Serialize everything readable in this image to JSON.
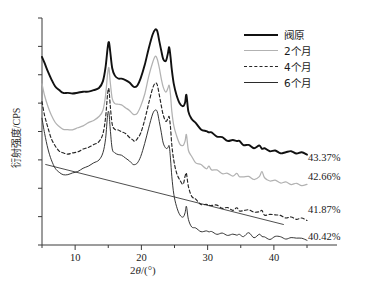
{
  "figure": {
    "ylabel": "衍射强度/CPS",
    "xlabel_prefix": "2",
    "xlabel_theta": "θ",
    "xlabel_suffix": "/(°)"
  },
  "legend": {
    "items": [
      {
        "label": "阀原",
        "style": "solid-thick",
        "color": "#111111"
      },
      {
        "label": "2个月",
        "style": "solid-gray",
        "color": "#b2b2b2"
      },
      {
        "label": "4个月",
        "style": "dashed",
        "color": "#262626"
      },
      {
        "label": "6个月",
        "style": "solid-thin",
        "color": "#2b2b2b"
      }
    ]
  },
  "annotations": [
    {
      "text": "43.37%",
      "series": "阀原"
    },
    {
      "text": "42.66%",
      "series": "2个月"
    },
    {
      "text": "41.87%",
      "series": "4个月"
    },
    {
      "text": "40.42%",
      "series": "6个月"
    }
  ],
  "xticks": [
    {
      "label": "10",
      "value": 10
    },
    {
      "label": "20",
      "value": 20
    },
    {
      "label": "30",
      "value": 30
    },
    {
      "label": "40",
      "value": 40
    }
  ],
  "chart_data": {
    "type": "line",
    "title": "",
    "xlabel": "2θ/(°)",
    "ylabel": "衍射强度/CPS",
    "xlim": [
      5,
      45
    ],
    "ylim": [
      0,
      100
    ],
    "grid": false,
    "legend_position": "top-right",
    "x_minor_ticks": [
      5,
      15,
      25,
      35,
      45
    ],
    "x_major_ticks": [
      10,
      20,
      30,
      40
    ],
    "y_axis_labeled": false,
    "y_tick_count": 9,
    "annotation_labels": [
      "43.37%",
      "42.66%",
      "41.87%",
      "40.42%"
    ],
    "baseline": {
      "x": [
        5.5,
        41.5
      ],
      "y": [
        35.5,
        9.0
      ]
    },
    "series": [
      {
        "name": "阀原",
        "crystallinity": "43.37%",
        "style": "solid-thick",
        "color": "#111111",
        "x": [
          5.0,
          5.4,
          5.9,
          6.4,
          7.0,
          7.6,
          8.2,
          8.9,
          9.6,
          10.4,
          11.2,
          12.0,
          12.8,
          13.6,
          14.2,
          14.6,
          14.9,
          15.1,
          15.3,
          15.6,
          16.0,
          16.5,
          17.0,
          17.6,
          18.2,
          18.7,
          19.0,
          19.4,
          19.9,
          20.5,
          21.1,
          21.7,
          22.1,
          22.4,
          22.7,
          23.0,
          23.3,
          23.7,
          24.0,
          24.2,
          24.4,
          24.6,
          24.9,
          25.3,
          25.8,
          26.3,
          26.6,
          26.8,
          27.1,
          27.6,
          28.2,
          29.0,
          29.8,
          30.2,
          30.6,
          31.4,
          32.2,
          33.0,
          33.8,
          34.4,
          34.8,
          35.4,
          36.2,
          37.0,
          37.8,
          38.2,
          38.6,
          39.4,
          40.2,
          41.0,
          41.8,
          42.6,
          43.4,
          44.2,
          45.0
        ],
        "y": [
          83.0,
          80.0,
          76.5,
          73.0,
          70.0,
          68.2,
          67.2,
          67.0,
          67.0,
          67.1,
          67.3,
          67.6,
          68.0,
          69.2,
          72.0,
          78.5,
          86.5,
          89.5,
          85.0,
          78.0,
          74.5,
          73.5,
          73.2,
          72.8,
          71.5,
          70.2,
          69.5,
          70.5,
          73.5,
          79.0,
          86.5,
          92.5,
          95.0,
          94.0,
          90.0,
          85.5,
          82.0,
          81.0,
          84.5,
          87.0,
          83.0,
          77.0,
          71.0,
          66.0,
          62.5,
          61.0,
          63.5,
          66.0,
          59.5,
          55.5,
          53.0,
          51.0,
          49.5,
          49.8,
          49.0,
          48.0,
          47.0,
          46.2,
          45.8,
          46.2,
          45.5,
          44.5,
          43.8,
          43.2,
          43.6,
          43.0,
          42.5,
          42.0,
          41.6,
          41.2,
          40.9,
          40.6,
          40.4,
          40.2,
          40.0
        ]
      },
      {
        "name": "2个月",
        "crystallinity": "42.66%",
        "style": "solid-gray",
        "color": "#b2b2b2",
        "x": [
          5.0,
          5.4,
          5.9,
          6.4,
          7.0,
          7.6,
          8.2,
          8.9,
          9.6,
          10.4,
          11.2,
          12.0,
          12.8,
          13.6,
          14.2,
          14.6,
          14.9,
          15.1,
          15.3,
          15.6,
          16.0,
          16.5,
          17.0,
          17.6,
          18.2,
          18.7,
          19.0,
          19.4,
          19.9,
          20.5,
          21.1,
          21.7,
          22.1,
          22.4,
          22.7,
          23.0,
          23.3,
          23.7,
          24.0,
          24.2,
          24.4,
          24.6,
          24.9,
          25.3,
          25.8,
          26.3,
          26.6,
          26.8,
          27.1,
          27.6,
          28.2,
          29.0,
          29.8,
          30.2,
          30.6,
          31.4,
          32.2,
          33.0,
          33.8,
          34.4,
          34.8,
          35.4,
          36.2,
          37.0,
          37.8,
          38.2,
          38.6,
          39.4,
          40.2,
          41.0,
          41.8,
          42.6,
          43.4,
          44.2,
          45.0
        ],
        "y": [
          71.0,
          66.0,
          61.0,
          57.0,
          54.0,
          52.0,
          51.0,
          50.6,
          50.8,
          51.5,
          52.6,
          53.8,
          55.0,
          56.5,
          59.5,
          66.0,
          75.5,
          78.0,
          72.0,
          64.5,
          62.5,
          62.0,
          61.5,
          60.5,
          59.0,
          57.8,
          57.2,
          58.2,
          61.0,
          66.5,
          74.0,
          80.5,
          83.0,
          82.0,
          78.0,
          73.5,
          69.5,
          67.5,
          69.0,
          70.5,
          66.0,
          59.0,
          52.5,
          48.0,
          44.5,
          43.2,
          46.0,
          48.0,
          42.0,
          38.5,
          36.5,
          35.0,
          34.0,
          34.4,
          33.6,
          32.8,
          32.0,
          31.4,
          31.0,
          31.4,
          30.8,
          30.0,
          29.4,
          28.9,
          29.4,
          32.5,
          29.0,
          28.4,
          28.0,
          27.6,
          27.3,
          27.0,
          26.8,
          26.6,
          26.4
        ]
      },
      {
        "name": "4个月",
        "crystallinity": "41.87%",
        "style": "dashed",
        "color": "#262626",
        "x": [
          5.0,
          5.4,
          5.9,
          6.4,
          7.0,
          7.6,
          8.2,
          8.9,
          9.6,
          10.4,
          11.2,
          12.0,
          12.8,
          13.6,
          14.2,
          14.6,
          14.9,
          15.1,
          15.3,
          15.6,
          16.0,
          16.5,
          17.0,
          17.6,
          18.2,
          18.7,
          19.0,
          19.4,
          19.9,
          20.5,
          21.1,
          21.7,
          22.1,
          22.4,
          22.7,
          23.0,
          23.3,
          23.7,
          24.0,
          24.2,
          24.4,
          24.6,
          24.9,
          25.3,
          25.8,
          26.3,
          26.6,
          26.8,
          27.1,
          27.6,
          28.2,
          29.0,
          29.8,
          30.2,
          30.6,
          31.4,
          32.2,
          33.0,
          33.8,
          34.4,
          34.8,
          35.4,
          36.2,
          37.0,
          37.8,
          38.2,
          38.6,
          39.4,
          40.2,
          41.0,
          41.8,
          42.6,
          43.4,
          44.2,
          45.0
        ],
        "y": [
          63.0,
          57.0,
          51.5,
          47.0,
          43.5,
          41.5,
          40.5,
          40.2,
          40.5,
          41.2,
          42.2,
          43.2,
          44.2,
          45.8,
          49.0,
          56.0,
          66.5,
          68.5,
          61.5,
          53.0,
          51.0,
          50.5,
          50.0,
          49.0,
          47.5,
          46.2,
          45.8,
          46.8,
          49.5,
          55.0,
          62.5,
          69.0,
          71.5,
          70.5,
          66.5,
          61.5,
          57.0,
          54.5,
          55.5,
          56.5,
          51.5,
          44.0,
          37.0,
          32.0,
          28.5,
          27.2,
          30.0,
          32.0,
          25.5,
          22.0,
          20.0,
          18.5,
          17.8,
          18.2,
          17.4,
          16.8,
          16.2,
          15.8,
          15.4,
          15.8,
          15.2,
          14.6,
          15.8,
          14.0,
          15.0,
          14.8,
          13.6,
          13.2,
          13.8,
          12.8,
          12.5,
          12.2,
          12.0,
          11.8,
          11.6
        ]
      },
      {
        "name": "6个月",
        "crystallinity": "40.42%",
        "style": "solid-thin",
        "color": "#2b2b2b",
        "x": [
          5.0,
          5.4,
          5.9,
          6.4,
          7.0,
          7.6,
          8.2,
          8.9,
          9.6,
          10.4,
          11.2,
          12.0,
          12.8,
          13.6,
          14.2,
          14.6,
          14.9,
          15.1,
          15.3,
          15.6,
          16.0,
          16.5,
          17.0,
          17.6,
          18.2,
          18.7,
          19.0,
          19.4,
          19.9,
          20.5,
          21.1,
          21.7,
          22.1,
          22.4,
          22.7,
          23.0,
          23.3,
          23.7,
          24.0,
          24.2,
          24.4,
          24.6,
          24.9,
          25.3,
          25.8,
          26.3,
          26.6,
          26.8,
          27.1,
          27.6,
          28.2,
          29.0,
          29.8,
          30.2,
          30.6,
          31.4,
          32.2,
          33.0,
          33.8,
          34.4,
          34.8,
          35.4,
          36.2,
          37.0,
          37.8,
          38.2,
          38.6,
          39.4,
          40.2,
          41.0,
          41.8,
          42.6,
          43.4,
          44.2,
          45.0
        ],
        "y": [
          56.0,
          49.0,
          42.5,
          37.5,
          34.0,
          32.0,
          31.2,
          31.0,
          31.5,
          32.4,
          33.6,
          34.8,
          36.0,
          37.5,
          40.5,
          47.0,
          57.0,
          58.5,
          51.0,
          42.5,
          40.5,
          40.0,
          39.5,
          38.5,
          37.0,
          35.8,
          35.4,
          36.4,
          39.0,
          44.5,
          51.5,
          57.5,
          59.5,
          58.5,
          54.5,
          49.5,
          45.0,
          42.5,
          43.0,
          43.5,
          38.0,
          30.0,
          22.5,
          17.0,
          13.5,
          12.2,
          15.0,
          17.0,
          10.5,
          8.0,
          6.8,
          6.0,
          5.6,
          6.0,
          5.4,
          5.0,
          4.8,
          4.6,
          4.4,
          4.8,
          4.4,
          4.2,
          5.2,
          3.8,
          4.6,
          4.4,
          3.5,
          3.2,
          3.8,
          2.9,
          2.7,
          2.6,
          3.2,
          2.4,
          2.3
        ]
      }
    ]
  }
}
